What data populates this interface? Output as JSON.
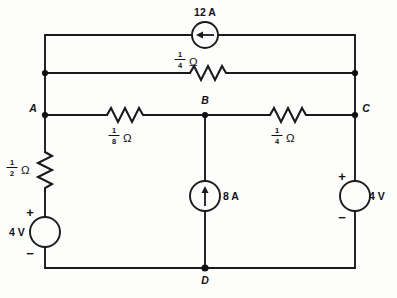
{
  "diagram": {
    "type": "circuit-schematic",
    "background_color": "#fdfdfc",
    "line_color": "#1a1a1a"
  },
  "nodes": [
    {
      "id": "A",
      "label": "A",
      "x": 45,
      "y": 115,
      "label_side": "left"
    },
    {
      "id": "B",
      "label": "B",
      "x": 205,
      "y": 115,
      "label_side": "top"
    },
    {
      "id": "C",
      "label": "C",
      "x": 355,
      "y": 115,
      "label_side": "right"
    },
    {
      "id": "D",
      "label": "D",
      "x": 205,
      "y": 268,
      "label_side": "bottom"
    },
    {
      "id": "TL",
      "label": "",
      "x": 45,
      "y": 73,
      "label_side": "none"
    },
    {
      "id": "TR",
      "label": "",
      "x": 355,
      "y": 73,
      "label_side": "none"
    }
  ],
  "components": {
    "current_source_top": {
      "name": "12 A current source",
      "value": "12 A",
      "orientation": "horizontal",
      "arrow_direction": "left",
      "cx": 205,
      "cy": 35,
      "label_x": 205,
      "label_y": 15
    },
    "current_source_middle": {
      "name": "8 A current source",
      "value": "8 A",
      "orientation": "vertical",
      "arrow_direction": "up",
      "cx": 205,
      "cy": 196,
      "label_x": 226,
      "label_y": 200
    },
    "resistor_top_rail": {
      "name": "quarter ohm resistor on upper rail",
      "numerator": "1",
      "denominator": "4",
      "unit": "Ω",
      "orientation": "horizontal",
      "cx": 208,
      "cy": 73,
      "label_x": 186,
      "label_y": 61
    },
    "resistor_ab": {
      "name": "one eighth ohm resistor between A and B",
      "numerator": "1",
      "denominator": "8",
      "unit": "Ω",
      "orientation": "horizontal",
      "cx": 125,
      "cy": 115,
      "label_x": 118,
      "label_y": 137
    },
    "resistor_bc": {
      "name": "quarter ohm resistor between B and C",
      "numerator": "1",
      "denominator": "4",
      "unit": "Ω",
      "orientation": "horizontal",
      "cx": 288,
      "cy": 115,
      "label_x": 280,
      "label_y": 137
    },
    "resistor_left": {
      "name": "half ohm resistor in left branch",
      "numerator": "1",
      "denominator": "2",
      "unit": "Ω",
      "orientation": "vertical",
      "cx": 45,
      "cy": 172,
      "label_x": 16,
      "label_y": 170
    },
    "voltage_source_left": {
      "name": "4 V source left branch",
      "value": "4 V",
      "cx": 45,
      "cy": 232,
      "label_x": 12,
      "label_y": 236,
      "plus_sign": "+",
      "minus_sign": "−",
      "plus_x": 34,
      "plus_y": 212,
      "minus_x": 34,
      "minus_y": 259
    },
    "voltage_source_right": {
      "name": "4 V source right branch",
      "value": "4 V",
      "cx": 355,
      "cy": 196,
      "label_x": 370,
      "label_y": 200,
      "plus_sign": "+",
      "minus_sign": "−",
      "plus_x": 344,
      "plus_y": 176,
      "minus_x": 344,
      "minus_y": 223
    }
  },
  "labels": {
    "source_12a": "12 A",
    "source_8a": "8 A",
    "source_4v_left": "4 V",
    "source_4v_right": "4 V",
    "node_a": "A",
    "node_b": "B",
    "node_c": "C",
    "node_d": "D",
    "ohm": "Ω"
  }
}
